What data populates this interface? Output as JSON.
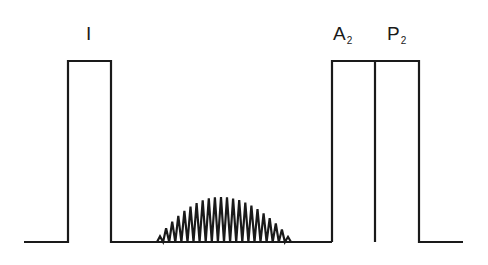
{
  "diagram": {
    "type": "phonocardiogram-schematic",
    "colors": {
      "stroke": "#1a1a1a",
      "background": "#ffffff"
    },
    "baseline_y": 242,
    "sounds": [
      {
        "id": "first-heart-sound",
        "label": "I",
        "label_main": "I",
        "label_sub": "",
        "x_start": 68,
        "x_end": 111,
        "top_y": 61
      },
      {
        "id": "aortic-component",
        "label": "A2",
        "label_main": "A",
        "label_sub": "2",
        "x_start": 332,
        "x_end": 375,
        "top_y": 61
      },
      {
        "id": "pulmonic-component",
        "label": "P2",
        "label_main": "P",
        "label_sub": "2",
        "x_start": 375,
        "x_end": 419,
        "top_y": 61
      }
    ],
    "murmur": {
      "shape": "crescendo-decrescendo (diamond)",
      "x_start": 157,
      "x_end": 291,
      "peak_y": 197,
      "oscillations": 22
    },
    "trace": {
      "x_start": 24,
      "x_end": 463
    }
  }
}
